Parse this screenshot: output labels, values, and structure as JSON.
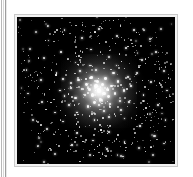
{
  "page": {
    "background_color": "#ffffff",
    "gutter_rule_colors": [
      "#b7b7b7",
      "#d8d8d8",
      "#9d9d9d",
      "#e8e8e8"
    ]
  },
  "figure": {
    "name": "globular-star-cluster-photograph",
    "frame_color": "#c9c9c9",
    "mat_color": "#f2f2f2",
    "sky_color": "#000000",
    "star_color": "#ffffff",
    "core": {
      "center_x_pct": 52,
      "center_y_pct": 50,
      "label": "cluster-core"
    }
  },
  "chart_data": {
    "type": "scatter",
    "xlabel": "",
    "ylabel": "",
    "xlim": [
      0,
      100
    ],
    "ylim": [
      0,
      100
    ],
    "grid": false,
    "legend": "none",
    "background": "#000000",
    "marker_color": "#ffffff",
    "annotation": "Dense luminous core at (52, 50) with stars resolving outward into a sparse field",
    "series": [
      {
        "name": "core-stars",
        "points": [
          [
            52,
            50,
            3.0
          ],
          [
            50,
            47,
            2.4
          ],
          [
            55,
            52,
            2.4
          ],
          [
            48,
            53,
            2.2
          ],
          [
            54,
            46,
            2.2
          ],
          [
            51,
            44,
            2.0
          ],
          [
            57,
            49,
            2.0
          ],
          [
            46,
            49,
            2.0
          ],
          [
            53,
            56,
            2.0
          ],
          [
            58,
            54,
            1.9
          ],
          [
            44,
            46,
            1.9
          ],
          [
            49,
            58,
            1.9
          ],
          [
            60,
            47,
            1.8
          ],
          [
            43,
            53,
            1.8
          ],
          [
            56,
            42,
            1.8
          ],
          [
            47,
            41,
            1.7
          ],
          [
            62,
            52,
            1.7
          ],
          [
            41,
            49,
            1.7
          ],
          [
            52,
            60,
            1.7
          ],
          [
            59,
            59,
            1.6
          ],
          [
            39,
            43,
            1.6
          ],
          [
            64,
            44,
            1.6
          ],
          [
            45,
            61,
            1.6
          ],
          [
            65,
            57,
            1.5
          ],
          [
            37,
            55,
            1.5
          ],
          [
            50,
            36,
            1.5
          ],
          [
            61,
            38,
            1.5
          ],
          [
            40,
            37,
            1.4
          ],
          [
            68,
            50,
            1.4
          ],
          [
            34,
            48,
            1.4
          ],
          [
            55,
            64,
            1.4
          ],
          [
            66,
            63,
            1.3
          ],
          [
            33,
            60,
            1.3
          ],
          [
            46,
            33,
            1.3
          ],
          [
            70,
            41,
            1.3
          ],
          [
            29,
            42,
            1.3
          ],
          [
            58,
            68,
            1.3
          ],
          [
            71,
            58,
            1.2
          ],
          [
            30,
            54,
            1.2
          ],
          [
            63,
            33,
            1.2
          ],
          [
            38,
            65,
            1.2
          ],
          [
            72,
            47,
            1.2
          ],
          [
            27,
            50,
            1.2
          ],
          [
            49,
            70,
            1.2
          ],
          [
            68,
            69,
            1.1
          ]
        ]
      },
      {
        "name": "halo-stars",
        "points": [
          [
            12,
            10,
            1.3
          ],
          [
            20,
            16,
            1.1
          ],
          [
            30,
            9,
            1.2
          ],
          [
            41,
            14,
            1.4
          ],
          [
            52,
            8,
            1.2
          ],
          [
            63,
            13,
            1.3
          ],
          [
            74,
            9,
            1.1
          ],
          [
            84,
            15,
            1.4
          ],
          [
            91,
            8,
            1.2
          ],
          [
            8,
            22,
            1.2
          ],
          [
            17,
            28,
            1.3
          ],
          [
            28,
            24,
            1.1
          ],
          [
            37,
            31,
            1.2
          ],
          [
            47,
            22,
            1.1
          ],
          [
            58,
            27,
            1.2
          ],
          [
            69,
            21,
            1.3
          ],
          [
            79,
            29,
            1.2
          ],
          [
            88,
            24,
            1.1
          ],
          [
            6,
            36,
            1.3
          ],
          [
            15,
            43,
            1.4
          ],
          [
            25,
            38,
            1.2
          ],
          [
            34,
            45,
            1.1
          ],
          [
            76,
            38,
            1.3
          ],
          [
            85,
            44,
            1.2
          ],
          [
            93,
            37,
            1.3
          ],
          [
            7,
            52,
            1.2
          ],
          [
            16,
            58,
            1.3
          ],
          [
            24,
            65,
            1.2
          ],
          [
            80,
            53,
            1.2
          ],
          [
            89,
            60,
            1.3
          ],
          [
            95,
            50,
            1.1
          ],
          [
            10,
            70,
            1.4
          ],
          [
            19,
            76,
            1.2
          ],
          [
            29,
            71,
            1.1
          ],
          [
            38,
            79,
            1.3
          ],
          [
            48,
            84,
            1.2
          ],
          [
            58,
            78,
            1.3
          ],
          [
            68,
            85,
            1.2
          ],
          [
            78,
            74,
            1.1
          ],
          [
            87,
            81,
            1.4
          ],
          [
            94,
            70,
            1.2
          ],
          [
            13,
            88,
            1.3
          ],
          [
            24,
            93,
            1.2
          ],
          [
            35,
            87,
            1.1
          ],
          [
            46,
            94,
            1.3
          ],
          [
            57,
            90,
            1.2
          ],
          [
            67,
            95,
            1.1
          ],
          [
            77,
            89,
            1.3
          ],
          [
            86,
            94,
            1.2
          ],
          [
            93,
            86,
            1.1
          ]
        ]
      }
    ]
  }
}
